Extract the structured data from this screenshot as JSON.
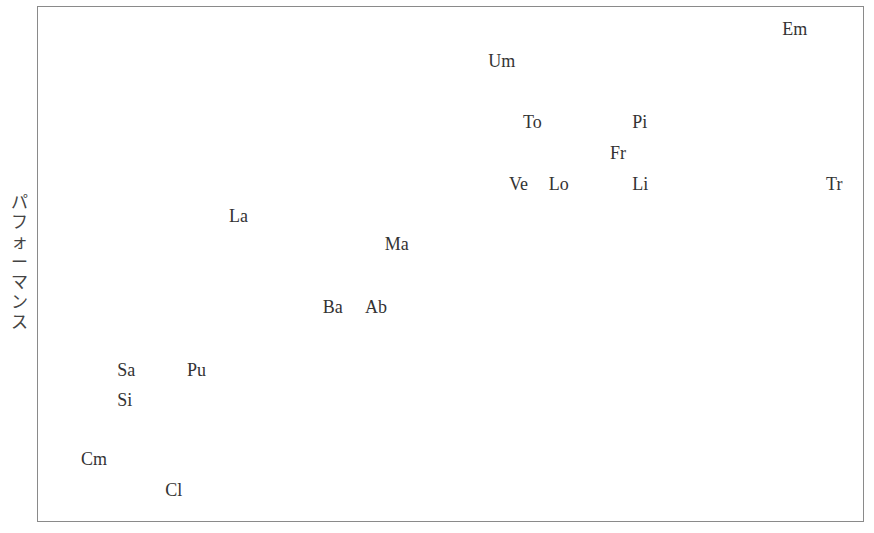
{
  "chart_data": {
    "type": "scatter",
    "title": "",
    "xlabel": "",
    "ylabel": "パフォーマンス",
    "grid": false,
    "legend": null,
    "axis_ticks": "none",
    "xlim": [
      0,
      100
    ],
    "ylim": [
      0,
      100
    ],
    "points": [
      {
        "label": "Em",
        "x": 90.0,
        "y": 95.5
      },
      {
        "label": "Um",
        "x": 54.5,
        "y": 89.3
      },
      {
        "label": "To",
        "x": 58.7,
        "y": 77.5
      },
      {
        "label": "Pi",
        "x": 71.9,
        "y": 77.5
      },
      {
        "label": "Fr",
        "x": 69.2,
        "y": 71.5
      },
      {
        "label": "Ve",
        "x": 57.0,
        "y": 65.5
      },
      {
        "label": "Lo",
        "x": 61.8,
        "y": 65.5
      },
      {
        "label": "Li",
        "x": 71.9,
        "y": 65.5
      },
      {
        "label": "Tr",
        "x": 95.3,
        "y": 65.5
      },
      {
        "label": "La",
        "x": 23.2,
        "y": 59.3
      },
      {
        "label": "Ma",
        "x": 42.0,
        "y": 53.9
      },
      {
        "label": "Ba",
        "x": 34.5,
        "y": 41.7
      },
      {
        "label": "Ab",
        "x": 39.6,
        "y": 41.7
      },
      {
        "label": "Sa",
        "x": 9.7,
        "y": 29.5
      },
      {
        "label": "Pu",
        "x": 18.1,
        "y": 29.5
      },
      {
        "label": "Si",
        "x": 9.7,
        "y": 23.6
      },
      {
        "label": "Cm",
        "x": 5.3,
        "y": 12.2
      },
      {
        "label": "Cl",
        "x": 15.5,
        "y": 6.2
      }
    ]
  },
  "ylabel_text": "パフォーマンス"
}
